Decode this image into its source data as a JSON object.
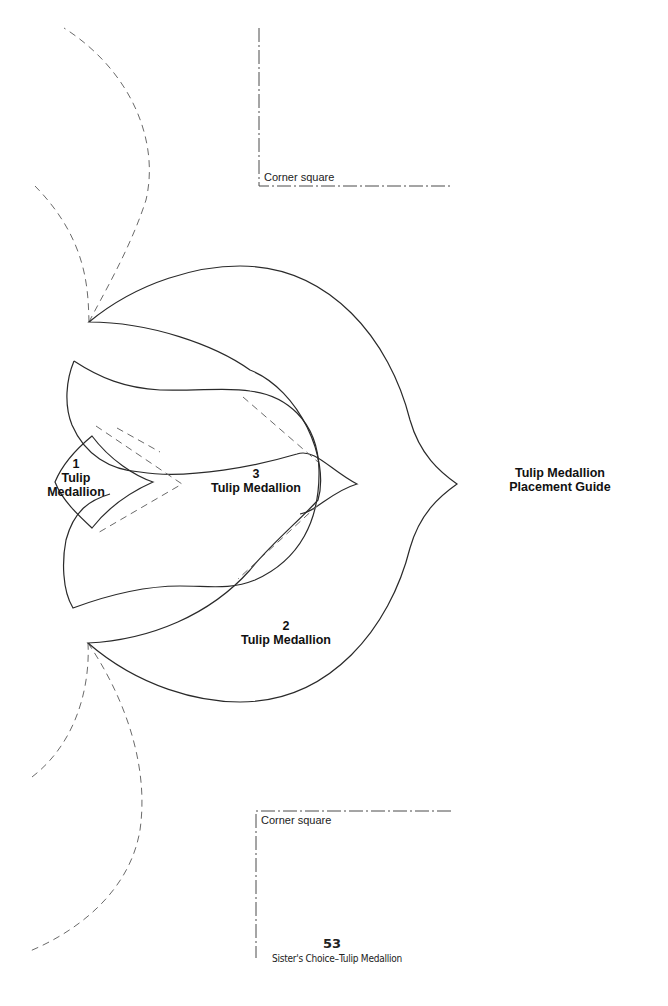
{
  "diagram": {
    "title": "Tulip Medallion Placement Guide",
    "title_lines": [
      "Tulip Medallion",
      "Placement Guide"
    ],
    "pieces": [
      {
        "number": "1",
        "name_lines": [
          "Tulip",
          "Medallion"
        ]
      },
      {
        "number": "2",
        "name": "Tulip Medallion"
      },
      {
        "number": "3",
        "name": "Tulip Medallion"
      }
    ],
    "corner_squares": [
      {
        "position": "top",
        "label": "Corner square"
      },
      {
        "position": "bottom",
        "label": "Corner square"
      }
    ],
    "line_styles": {
      "solid": "appliqué piece outline",
      "dashed": "placement / seam guide",
      "dash_dot": "corner square edge"
    },
    "colors": {
      "background": "#ffffff",
      "outline": "#2a2a2a",
      "guide": "#6a6a6a"
    }
  },
  "footer": {
    "page_number": "53",
    "caption": "Sister's Choice–Tulip Medallion"
  }
}
